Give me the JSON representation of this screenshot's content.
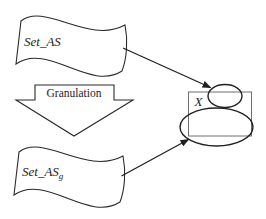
{
  "figure": {
    "background_color": "#ffffff",
    "line_color": "#2a2a2a",
    "container_line_color": "#6e6e6e",
    "text_color": "#1c1c1c",
    "nodes": {
      "set_as": {
        "shape": "wavy-document",
        "label": "Set_AS"
      },
      "set_as_g": {
        "shape": "wavy-document",
        "label_base": "Set_AS",
        "label_subscript": "g"
      },
      "x_container": {
        "shape": "rectangle",
        "label": "X"
      },
      "granule_small": {
        "shape": "ellipse",
        "label": ""
      },
      "granule_large": {
        "shape": "ellipse",
        "label": ""
      }
    },
    "process": {
      "shape": "block-arrow-down",
      "label": "Granulation",
      "from": "set_as",
      "to": "set_as_g"
    },
    "edges": [
      {
        "from": "set_as",
        "to": "granule_small",
        "style": "arrow"
      },
      {
        "from": "set_as_g",
        "to": "granule_large",
        "style": "arrow"
      }
    ]
  }
}
